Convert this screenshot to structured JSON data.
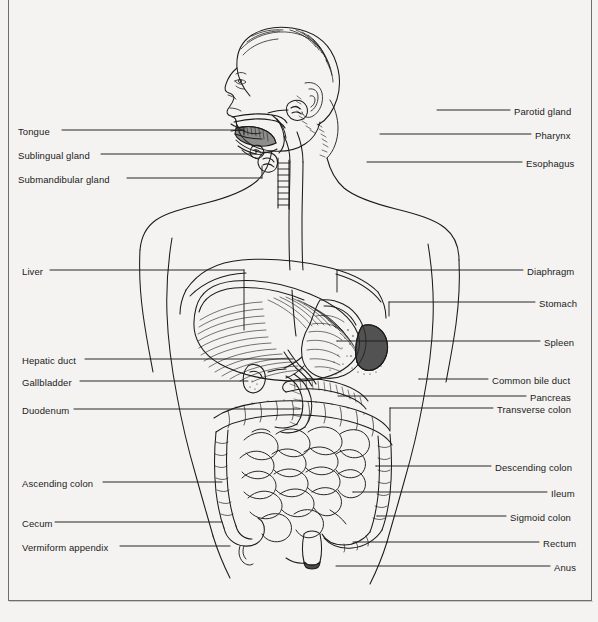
{
  "diagram": {
    "view": "anterior torso with sagittal head section",
    "style": "black-and-white line drawing on off-white paper",
    "background_color": "#f4f3f1",
    "ink_color": "#1b1b1b",
    "frame_color": "#6e6e6e"
  },
  "labels_left": [
    {
      "text": "Tongue",
      "x": 18,
      "y": 126,
      "line_x1": 62,
      "line_x2": 244,
      "line_y": 130
    },
    {
      "text": "Sublingual gland",
      "x": 18,
      "y": 150,
      "line_x1": 101,
      "line_x2": 256,
      "line_y": 154
    },
    {
      "text": "Submandibular gland",
      "x": 18,
      "y": 174,
      "line_x1": 127,
      "line_x2": 262,
      "line_y": 178
    },
    {
      "text": "Liver",
      "x": 22,
      "y": 266,
      "line_x1": 50,
      "line_x2": 244,
      "line_y": 270
    },
    {
      "text": "Hepatic duct",
      "x": 22,
      "y": 355,
      "line_x1": 85,
      "line_x2": 293,
      "line_y": 359
    },
    {
      "text": "Gallbladder",
      "x": 22,
      "y": 377,
      "line_x1": 80,
      "line_x2": 248,
      "line_y": 381
    },
    {
      "text": "Duodenum",
      "x": 22,
      "y": 405,
      "line_x1": 74,
      "line_x2": 300,
      "line_y": 409
    },
    {
      "text": "Ascending colon",
      "x": 22,
      "y": 478,
      "line_x1": 103,
      "line_x2": 222,
      "line_y": 482
    },
    {
      "text": "Cecum",
      "x": 22,
      "y": 518,
      "line_x1": 55,
      "line_x2": 222,
      "line_y": 522
    },
    {
      "text": "Vermiform appendix",
      "x": 22,
      "y": 542,
      "line_x1": 120,
      "line_x2": 230,
      "line_y": 546
    }
  ],
  "labels_right": [
    {
      "text": "Parotid gland",
      "x": 514,
      "y": 106,
      "line_x1": 437,
      "line_x2": 510,
      "line_y": 110
    },
    {
      "text": "Pharynx",
      "x": 535,
      "y": 130,
      "line_x1": 380,
      "line_x2": 531,
      "line_y": 134
    },
    {
      "text": "Esophagus",
      "x": 526,
      "y": 158,
      "line_x1": 367,
      "line_x2": 522,
      "line_y": 162
    },
    {
      "text": "Diaphragm",
      "x": 527,
      "y": 266,
      "line_x1": 337,
      "line_x2": 523,
      "line_y": 270
    },
    {
      "text": "Stomach",
      "x": 539,
      "y": 298,
      "line_x1": 389,
      "line_x2": 535,
      "line_y": 302
    },
    {
      "text": "Spleen",
      "x": 544,
      "y": 337,
      "line_x1": 337,
      "line_x2": 540,
      "line_y": 341
    },
    {
      "text": "Common bile duct",
      "x": 492,
      "y": 375,
      "line_x1": 419,
      "line_x2": 488,
      "line_y": 379
    },
    {
      "text": "Pancreas",
      "x": 530,
      "y": 392,
      "line_x1": 338,
      "line_x2": 526,
      "line_y": 396
    },
    {
      "text": "Transverse colon",
      "x": 497,
      "y": 404,
      "line_x1": 390,
      "line_x2": 493,
      "line_y": 408
    },
    {
      "text": "Descending colon",
      "x": 495,
      "y": 462,
      "line_x1": 376,
      "line_x2": 491,
      "line_y": 466
    },
    {
      "text": "Ileum",
      "x": 551,
      "y": 488,
      "line_x1": 353,
      "line_x2": 547,
      "line_y": 492
    },
    {
      "text": "Sigmoid colon",
      "x": 510,
      "y": 512,
      "line_x1": 377,
      "line_x2": 506,
      "line_y": 516
    },
    {
      "text": "Rectum",
      "x": 543,
      "y": 538,
      "line_x1": 353,
      "line_x2": 539,
      "line_y": 542
    },
    {
      "text": "Anus",
      "x": 554,
      "y": 562,
      "line_x1": 336,
      "line_x2": 550,
      "line_y": 566
    }
  ],
  "organ_parts": [
    "tongue",
    "sublingual-gland",
    "submandibular-gland",
    "parotid-gland",
    "pharynx",
    "esophagus",
    "trachea",
    "diaphragm",
    "liver",
    "stomach",
    "spleen",
    "hepatic-duct",
    "gallbladder",
    "common-bile-duct",
    "pancreas",
    "duodenum",
    "transverse-colon",
    "ascending-colon",
    "descending-colon",
    "ileum",
    "cecum",
    "vermiform-appendix",
    "sigmoid-colon",
    "rectum",
    "anus"
  ]
}
